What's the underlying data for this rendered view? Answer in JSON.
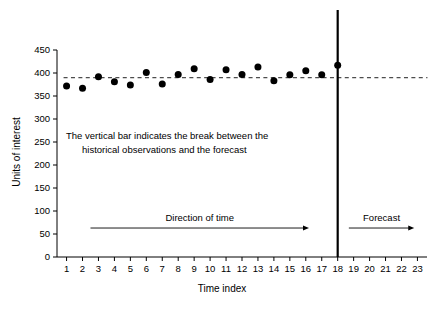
{
  "chart_data": {
    "type": "scatter",
    "title": "",
    "xlabel": "Time index",
    "ylabel": "Units of interest",
    "xlim": [
      0.4,
      23.6
    ],
    "ylim": [
      0,
      450
    ],
    "grid": false,
    "legend": "none",
    "x": [
      1,
      2,
      3,
      4,
      5,
      6,
      7,
      8,
      9,
      10,
      11,
      12,
      13,
      14,
      15,
      16,
      17,
      18
    ],
    "values": [
      372,
      367,
      392,
      381,
      374,
      401,
      376,
      397,
      409,
      386,
      407,
      397,
      413,
      383,
      396,
      405,
      396,
      417
    ],
    "series": [
      {
        "name": "Observations and forecast",
        "x": [
          1,
          2,
          3,
          4,
          5,
          6,
          7,
          8,
          9,
          10,
          11,
          12,
          13,
          14,
          15,
          16,
          17,
          18
        ],
        "values": [
          372,
          367,
          392,
          381,
          374,
          401,
          376,
          397,
          409,
          386,
          407,
          397,
          413,
          383,
          396,
          405,
          396,
          417
        ]
      }
    ],
    "reference_line": {
      "name": "mean level",
      "value": 390,
      "style": "dashed",
      "x_start": 1,
      "x_end": 23
    },
    "break_line": {
      "name": "forecast break",
      "x": 18,
      "style": "solid-vertical"
    },
    "xticks": [
      1,
      2,
      3,
      4,
      5,
      6,
      7,
      8,
      9,
      10,
      11,
      12,
      13,
      14,
      15,
      16,
      17,
      18,
      19,
      20,
      21,
      22,
      23
    ],
    "xtick_labels": [
      "1",
      "2",
      "3",
      "4",
      "5",
      "6",
      "7",
      "8",
      "9",
      "10",
      "11",
      "12",
      "13",
      "14",
      "15",
      "16",
      "17",
      "18",
      "19",
      "20",
      "21",
      "22",
      "23"
    ],
    "yticks": [
      0,
      50,
      100,
      150,
      200,
      250,
      300,
      350,
      400,
      450
    ],
    "ytick_labels": [
      "0",
      "50",
      "100",
      "150",
      "200",
      "250",
      "300",
      "350",
      "400",
      "450"
    ],
    "annotations": [
      {
        "name": "break-note",
        "line1": "The vertical bar indicates the break between the",
        "line2": "historical observations and the forecast"
      },
      {
        "name": "direction-of-time-arrow",
        "label": "Direction of time",
        "x_start": 2.5,
        "x_end": 16.2,
        "y": 63
      },
      {
        "name": "forecast-arrow",
        "label": "Forecast",
        "x_start": 18.7,
        "x_end": 22.8,
        "y": 63
      }
    ],
    "colors": {
      "point": "#000000",
      "mean_line": "#4d4d4d",
      "axis": "#000000",
      "background": "#ffffff"
    }
  }
}
